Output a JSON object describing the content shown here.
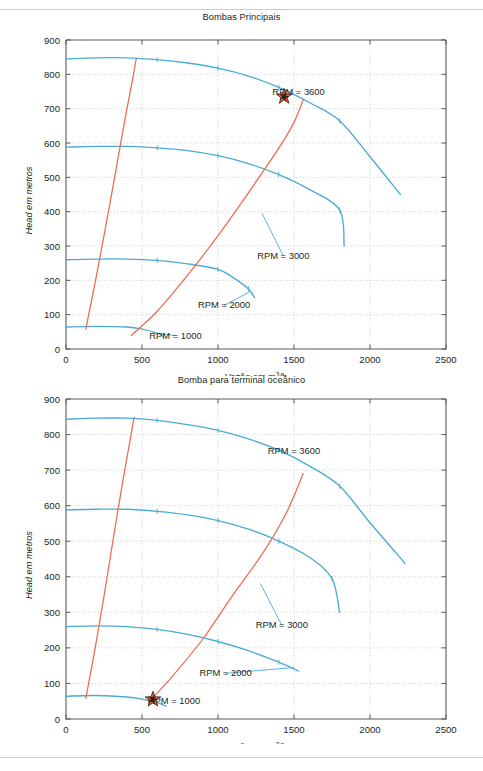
{
  "page": {
    "background": "#ffffff",
    "rule_color": "#c9cbcd"
  },
  "colors": {
    "pump_curve": "#4aabd4",
    "system_curve": "#ee6a4f",
    "star_fill": "#f05a28",
    "star_stroke": "#231f20",
    "axis": "#58595b",
    "grid": "#b4b6b8",
    "text": "#231f20"
  },
  "charts": [
    {
      "id": "bombas-principais",
      "chart_data": {
        "type": "line",
        "title": "Bombas Principais",
        "xlabel": "Vazão em m³/h",
        "ylabel": "Head em metros",
        "xlim": [
          0,
          2500
        ],
        "ylim": [
          0,
          900
        ],
        "xticks": [
          0,
          500,
          1000,
          1500,
          2000,
          2500
        ],
        "yticks": [
          0,
          100,
          200,
          300,
          400,
          500,
          600,
          700,
          800,
          900
        ],
        "grid": true,
        "legend": "inline-annotations",
        "series": [
          {
            "name": "RPM = 3600",
            "kind": "pump-curve",
            "color": "#4aabd4",
            "points": [
              [
                0,
                845
              ],
              [
                200,
                848
              ],
              [
                400,
                848
              ],
              [
                600,
                843
              ],
              [
                800,
                833
              ],
              [
                1000,
                818
              ],
              [
                1200,
                795
              ],
              [
                1400,
                762
              ],
              [
                1600,
                718
              ],
              [
                1800,
                665
              ],
              [
                2000,
                560
              ],
              [
                2200,
                450
              ]
            ]
          },
          {
            "name": "RPM = 3000",
            "kind": "pump-curve",
            "color": "#4aabd4",
            "points": [
              [
                0,
                588
              ],
              [
                200,
                590
              ],
              [
                400,
                590
              ],
              [
                600,
                586
              ],
              [
                800,
                578
              ],
              [
                1000,
                563
              ],
              [
                1200,
                540
              ],
              [
                1400,
                508
              ],
              [
                1600,
                465
              ],
              [
                1800,
                405
              ],
              [
                1830,
                300
              ]
            ]
          },
          {
            "name": "RPM = 2000",
            "kind": "pump-curve",
            "color": "#4aabd4",
            "points": [
              [
                0,
                260
              ],
              [
                200,
                262
              ],
              [
                400,
                262
              ],
              [
                600,
                258
              ],
              [
                800,
                248
              ],
              [
                1000,
                232
              ],
              [
                1100,
                208
              ],
              [
                1200,
                175
              ],
              [
                1240,
                150
              ]
            ]
          },
          {
            "name": "RPM = 1000",
            "kind": "pump-curve",
            "color": "#4aabd4",
            "points": [
              [
                0,
                64
              ],
              [
                200,
                66
              ],
              [
                400,
                64
              ],
              [
                500,
                58
              ],
              [
                600,
                46
              ],
              [
                640,
                36
              ]
            ]
          },
          {
            "name": "system-curve-steep",
            "kind": "system-curve",
            "color": "#ee6a4f",
            "points": [
              [
                130,
                58
              ],
              [
                190,
                190
              ],
              [
                250,
                330
              ],
              [
                320,
                500
              ],
              [
                380,
                650
              ],
              [
                440,
                790
              ],
              [
                462,
                845
              ]
            ]
          },
          {
            "name": "system-curve-shallow",
            "kind": "system-curve",
            "color": "#ee6a4f",
            "points": [
              [
                430,
                40
              ],
              [
                600,
                110
              ],
              [
                800,
                215
              ],
              [
                1000,
                330
              ],
              [
                1200,
                455
              ],
              [
                1400,
                585
              ],
              [
                1500,
                660
              ],
              [
                1560,
                725
              ]
            ]
          }
        ],
        "annotations": [
          {
            "text": "RPM = 3600",
            "x": 1530,
            "y": 740,
            "leader": false
          },
          {
            "text": "RPM = 3000",
            "x": 1430,
            "y": 262,
            "leader": true,
            "leader_to": [
              1290,
              395
            ]
          },
          {
            "text": "RPM = 2000",
            "x": 1040,
            "y": 118,
            "leader": true,
            "leader_to": [
              1215,
              168
            ]
          },
          {
            "text": "RPM = 1000",
            "x": 720,
            "y": 30,
            "leader": true,
            "leader_to": [
              625,
              45
            ]
          }
        ],
        "markers": [
          {
            "type": "star",
            "name": "operating-point",
            "x": 1435,
            "y": 735
          }
        ]
      }
    },
    {
      "id": "bomba-terminal-oceanico",
      "chart_data": {
        "type": "line",
        "title": "Bomba para terminal oceânico",
        "xlabel": "Vazão em m³/h",
        "ylabel": "Head em metros",
        "xlim": [
          0,
          2500
        ],
        "ylim": [
          0,
          900
        ],
        "xticks": [
          0,
          500,
          1000,
          1500,
          2000,
          2500
        ],
        "yticks": [
          0,
          100,
          200,
          300,
          400,
          500,
          600,
          700,
          800,
          900
        ],
        "grid": true,
        "legend": "inline-annotations",
        "series": [
          {
            "name": "RPM = 3600",
            "kind": "pump-curve",
            "color": "#4aabd4",
            "points": [
              [
                0,
                843
              ],
              [
                200,
                846
              ],
              [
                400,
                846
              ],
              [
                600,
                840
              ],
              [
                800,
                828
              ],
              [
                1000,
                812
              ],
              [
                1200,
                788
              ],
              [
                1400,
                756
              ],
              [
                1600,
                712
              ],
              [
                1800,
                655
              ],
              [
                2000,
                552
              ],
              [
                2230,
                438
              ]
            ]
          },
          {
            "name": "RPM = 3000",
            "kind": "pump-curve",
            "color": "#4aabd4",
            "points": [
              [
                0,
                588
              ],
              [
                200,
                590
              ],
              [
                400,
                590
              ],
              [
                600,
                584
              ],
              [
                800,
                574
              ],
              [
                1000,
                558
              ],
              [
                1200,
                534
              ],
              [
                1400,
                500
              ],
              [
                1600,
                455
              ],
              [
                1750,
                395
              ],
              [
                1800,
                300
              ]
            ]
          },
          {
            "name": "RPM = 2000",
            "kind": "pump-curve",
            "color": "#4aabd4",
            "points": [
              [
                0,
                260
              ],
              [
                200,
                262
              ],
              [
                400,
                260
              ],
              [
                600,
                252
              ],
              [
                800,
                238
              ],
              [
                1000,
                218
              ],
              [
                1200,
                192
              ],
              [
                1400,
                160
              ],
              [
                1530,
                135
              ]
            ]
          },
          {
            "name": "RPM = 1000",
            "kind": "pump-curve",
            "color": "#4aabd4",
            "points": [
              [
                0,
                64
              ],
              [
                200,
                66
              ],
              [
                400,
                62
              ],
              [
                500,
                56
              ],
              [
                600,
                46
              ],
              [
                660,
                36
              ]
            ]
          },
          {
            "name": "system-curve-steep",
            "kind": "system-curve",
            "color": "#ee6a4f",
            "points": [
              [
                130,
                58
              ],
              [
                190,
                195
              ],
              [
                250,
                345
              ],
              [
                310,
                505
              ],
              [
                370,
                660
              ],
              [
                430,
                805
              ],
              [
                448,
                848
              ]
            ]
          },
          {
            "name": "system-curve-shallow",
            "kind": "system-curve",
            "color": "#ee6a4f",
            "points": [
              [
                560,
                55
              ],
              [
                700,
                120
              ],
              [
                900,
                225
              ],
              [
                1100,
                350
              ],
              [
                1300,
                470
              ],
              [
                1450,
                580
              ],
              [
                1560,
                690
              ]
            ]
          }
        ],
        "annotations": [
          {
            "text": "RPM = 3600",
            "x": 1500,
            "y": 745,
            "leader": false
          },
          {
            "text": "RPM = 3000",
            "x": 1420,
            "y": 255,
            "leader": true,
            "leader_to": [
              1280,
              380
            ]
          },
          {
            "text": "RPM = 2000",
            "x": 1050,
            "y": 120,
            "leader": true,
            "leader_to": [
              1500,
              145
            ]
          },
          {
            "text": "RPM = 1000",
            "x": 710,
            "y": 42,
            "leader": false
          }
        ],
        "markers": [
          {
            "type": "star",
            "name": "operating-point",
            "x": 572,
            "y": 55
          }
        ]
      }
    }
  ]
}
